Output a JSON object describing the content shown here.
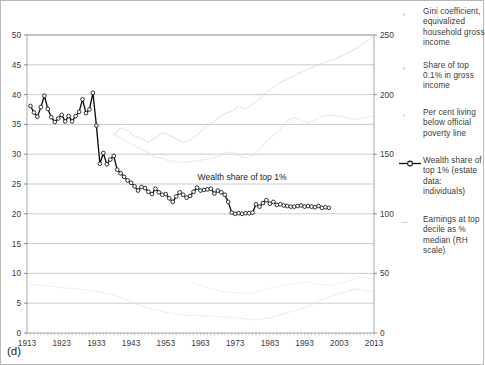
{
  "figure": {
    "panel_label": "(d)",
    "annotation": "Wealth share of top 1%"
  },
  "legend": {
    "items": [
      {
        "marker": "faint-dot-marker",
        "label": "Gini coefficient, equivalized household gross income"
      },
      {
        "marker": "faint-dot-marker",
        "label": "Share of top 0.1% in gross income"
      },
      {
        "marker": "faint-dot-marker",
        "label": "Per cent living below official poverty line"
      },
      {
        "marker": "circle-line-marker",
        "label": "Wealth share of top 1% (estate data: individuals)"
      },
      {
        "marker": "faint-dash-marker",
        "label": "Earnings at top decile as % median (RH scale)"
      }
    ]
  },
  "chart_data": {
    "type": "line",
    "title": "",
    "xlabel": "",
    "ylabel": "",
    "xlim": [
      1913,
      2013
    ],
    "ylim": [
      0,
      50
    ],
    "ylim_right": [
      0,
      250
    ],
    "grid": true,
    "legend_position": "right",
    "xticks": [
      1913,
      1923,
      1933,
      1943,
      1953,
      1963,
      1973,
      1983,
      1993,
      2003,
      2013
    ],
    "yticks_left": [
      0,
      5,
      10,
      15,
      20,
      25,
      30,
      35,
      40,
      45,
      50
    ],
    "yticks_right": [
      0,
      50,
      100,
      150,
      200,
      250
    ],
    "annotations": [
      {
        "text": "Wealth share of top 1%",
        "x": 1975,
        "y": 25.6
      }
    ],
    "series": [
      {
        "name": "Wealth share of top 1% (estate data: individuals)",
        "axis": "left",
        "style": "markers-line-dark",
        "color": "#111111",
        "x": [
          1914,
          1915,
          1916,
          1917,
          1918,
          1919,
          1920,
          1921,
          1922,
          1923,
          1924,
          1925,
          1926,
          1927,
          1928,
          1929,
          1930,
          1931,
          1932,
          1933,
          1934,
          1935,
          1936,
          1937,
          1938,
          1939,
          1940,
          1941,
          1942,
          1943,
          1944,
          1945,
          1946,
          1947,
          1948,
          1949,
          1950,
          1951,
          1952,
          1953,
          1954,
          1955,
          1956,
          1957,
          1958,
          1959,
          1960,
          1961,
          1962,
          1963,
          1964,
          1965,
          1966,
          1967,
          1968,
          1969,
          1970,
          1971,
          1972,
          1973,
          1974,
          1975,
          1976,
          1977,
          1978,
          1979,
          1980,
          1981,
          1982,
          1983,
          1984,
          1985,
          1986,
          1987,
          1988,
          1989,
          1990,
          1991,
          1992,
          1993,
          1994,
          1995,
          1996,
          1997,
          1998,
          1999,
          2000
        ],
        "y": [
          38.1,
          37.0,
          36.3,
          37.9,
          39.8,
          37.6,
          36.2,
          35.4,
          36.0,
          36.6,
          35.5,
          36.4,
          35.5,
          36.4,
          37.1,
          39.2,
          36.9,
          37.5,
          40.3,
          34.8,
          28.4,
          30.2,
          28.3,
          29.1,
          29.7,
          27.4,
          26.8,
          26.2,
          25.6,
          25.2,
          24.6,
          23.9,
          24.5,
          24.3,
          23.7,
          23.3,
          24.2,
          23.6,
          23.2,
          23.3,
          22.6,
          22.0,
          22.9,
          23.6,
          23.2,
          22.7,
          23.0,
          23.7,
          24.4,
          23.9,
          24.0,
          24.1,
          24.2,
          23.4,
          23.9,
          23.6,
          23.2,
          22.0,
          20.2,
          20.0,
          20.1,
          20.0,
          20.1,
          20.1,
          20.2,
          21.6,
          21.2,
          21.8,
          22.3,
          21.7,
          22.0,
          21.5,
          21.6,
          21.4,
          21.3,
          21.2,
          21.2,
          21.3,
          21.4,
          21.2,
          21.3,
          21.2,
          21.1,
          21.3,
          21.0,
          21.1,
          21.0
        ]
      },
      {
        "name": "Earnings at top decile as % median (RH scale)",
        "axis": "right",
        "style": "faint-dots",
        "color": "#d6d6d6",
        "x": [
          1938,
          1940,
          1942,
          1944,
          1946,
          1948,
          1950,
          1952,
          1954,
          1956,
          1958,
          1960,
          1962,
          1964,
          1966,
          1968,
          1970,
          1972,
          1974,
          1976,
          1978,
          1980,
          1982,
          1984,
          1986,
          1988,
          1990,
          1992,
          1994,
          1996,
          1998,
          2000,
          2002,
          2004,
          2006,
          2008,
          2010,
          2012,
          2013
        ],
        "y": [
          166,
          172,
          170,
          165,
          163,
          160,
          164,
          168,
          166,
          163,
          160,
          162,
          166,
          172,
          176,
          180,
          184,
          186,
          190,
          188,
          192,
          196,
          202,
          206,
          210,
          213,
          216,
          219,
          221,
          224,
          226,
          228,
          230,
          233,
          236,
          239,
          243,
          247,
          249
        ]
      },
      {
        "name": "Gini coefficient, equivalized household gross income",
        "axis": "left",
        "style": "faint-dots",
        "color": "#dcdcdc",
        "x": [
          1938,
          1942,
          1946,
          1950,
          1954,
          1958,
          1962,
          1966,
          1968,
          1970,
          1972,
          1974,
          1976,
          1978,
          1980,
          1982,
          1984,
          1986,
          1988,
          1990,
          1992,
          1994,
          1996,
          1998,
          2000,
          2004,
          2008,
          2012,
          2013
        ],
        "y": [
          33.4,
          32.1,
          30.8,
          29.6,
          28.9,
          28.6,
          28.9,
          29.3,
          29.6,
          30.2,
          30.4,
          29.8,
          29.4,
          29.8,
          30.8,
          32.1,
          33.2,
          34.2,
          35.6,
          36.2,
          35.6,
          35.3,
          35.8,
          36.3,
          36.6,
          36.3,
          35.8,
          36.4,
          36.2
        ]
      },
      {
        "name": "Share of top 0.1% in gross income",
        "axis": "left",
        "style": "faint-dots",
        "color": "#e2e2e2",
        "x": [
          1913,
          1918,
          1923,
          1928,
          1933,
          1938,
          1943,
          1948,
          1953,
          1958,
          1963,
          1968,
          1973,
          1978,
          1983,
          1988,
          1993,
          1998,
          2003,
          2008,
          2012,
          2013
        ],
        "y": [
          8.2,
          8.0,
          7.6,
          7.4,
          7.0,
          6.4,
          5.2,
          4.2,
          3.5,
          3.0,
          2.9,
          2.8,
          2.6,
          2.2,
          2.5,
          3.4,
          4.2,
          5.6,
          6.6,
          7.4,
          6.9,
          7.2
        ]
      },
      {
        "name": "Per cent living below official poverty line",
        "axis": "left",
        "style": "faint-dots",
        "color": "#e6e6e6",
        "x": [
          1961,
          1965,
          1969,
          1973,
          1977,
          1981,
          1985,
          1989,
          1993,
          1997,
          2001,
          2005,
          2009,
          2013
        ],
        "y": [
          8.4,
          7.6,
          7.0,
          6.8,
          6.6,
          7.2,
          7.8,
          8.2,
          8.6,
          8.2,
          8.0,
          8.6,
          9.4,
          9.0
        ]
      }
    ]
  }
}
